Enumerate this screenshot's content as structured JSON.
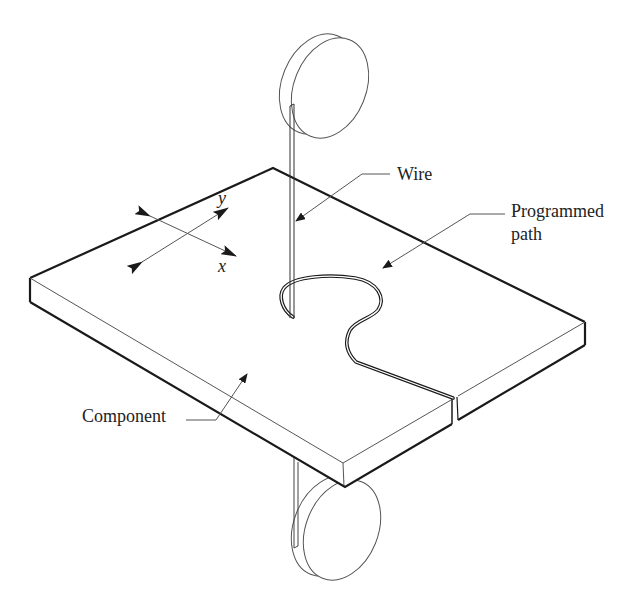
{
  "figure": {
    "type": "isometric schematic"
  },
  "labels": {
    "wire": "Wire",
    "programmed_path_line1": "Programmed",
    "programmed_path_line2": "path",
    "component": "Component",
    "axis_x": "x",
    "axis_y": "y"
  },
  "colors": {
    "line": "#1a1a1a",
    "thin_line": "#555555",
    "background": "#ffffff"
  }
}
